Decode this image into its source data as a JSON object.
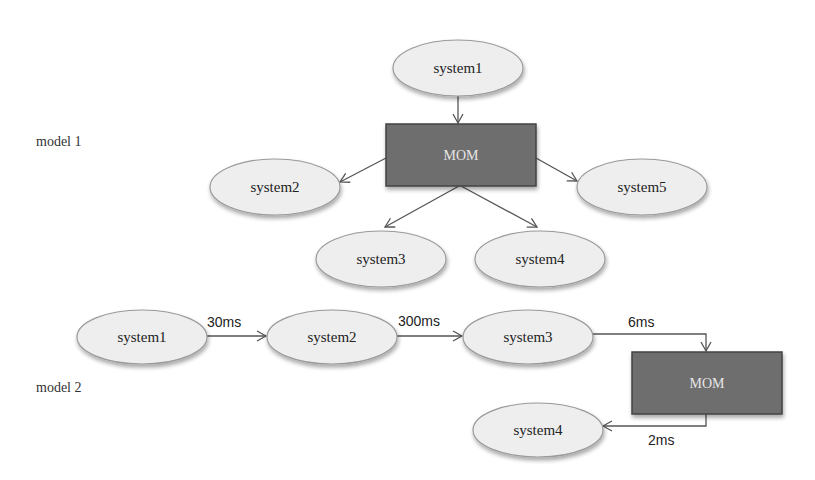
{
  "model1": {
    "label": "model 1",
    "source": {
      "label": "system1"
    },
    "hub": {
      "label": "MOM",
      "fill": "#6e6e6e"
    },
    "targets": [
      {
        "label": "system2"
      },
      {
        "label": "system3"
      },
      {
        "label": "system4"
      },
      {
        "label": "system5"
      }
    ]
  },
  "model2": {
    "label": "model 2",
    "chain": [
      {
        "label": "system1"
      },
      {
        "label": "system2"
      },
      {
        "label": "system3"
      }
    ],
    "hub": {
      "label": "MOM",
      "fill": "#6e6e6e"
    },
    "end": {
      "label": "system4"
    },
    "latencies": [
      "30ms",
      "300ms",
      "6ms",
      "2ms"
    ]
  },
  "colors": {
    "ellipse_fill": "#eeeeee",
    "ellipse_stroke": "#9a9a9a",
    "hub_fill": "#6e6e6e",
    "hub_stroke": "#444444",
    "edge": "#555555"
  }
}
